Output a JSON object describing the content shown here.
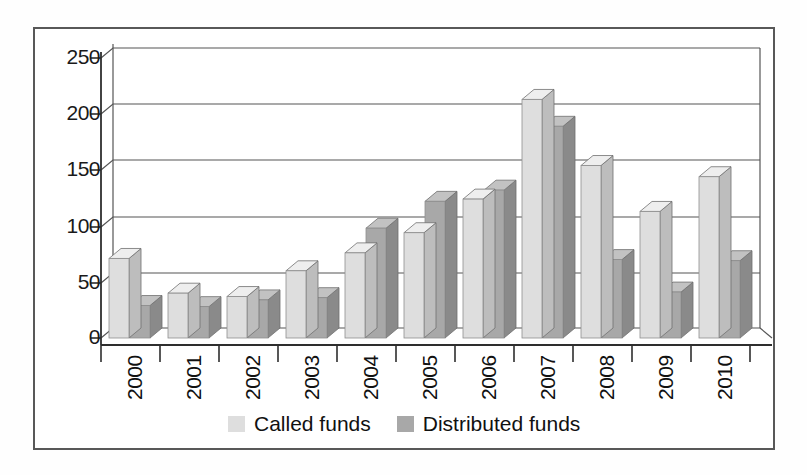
{
  "chart_data": {
    "type": "bar",
    "title": "",
    "subtitle": "",
    "xlabel": "",
    "ylabel": "",
    "categories": [
      "2000",
      "2001",
      "2002",
      "2003",
      "2004",
      "2005",
      "2006",
      "2007",
      "2008",
      "2009",
      "2010"
    ],
    "series": [
      {
        "name": "Called funds",
        "color": "#dedede",
        "values": [
          71,
          40,
          37,
          60,
          76,
          94,
          124,
          213,
          154,
          113,
          144
        ]
      },
      {
        "name": "Distributed funds",
        "color": "#a8a8a8",
        "values": [
          29,
          28,
          34,
          36,
          98,
          122,
          132,
          189,
          70,
          41,
          69
        ]
      }
    ],
    "ylim": [
      0,
      250
    ],
    "yticks": [
      0,
      50,
      100,
      150,
      200,
      250
    ],
    "ytick_labels": [
      "0",
      "50",
      "100",
      "150",
      "200",
      "250"
    ],
    "grid": true,
    "grid_axis": "y",
    "legend_position": "bottom",
    "style": "3d-column",
    "annotations": []
  },
  "axes": {
    "y_tick_labels": [
      "250",
      "200",
      "150",
      "100",
      "50",
      "0"
    ],
    "x_tick_labels": [
      "2000",
      "2001",
      "2002",
      "2003",
      "2004",
      "2005",
      "2006",
      "2007",
      "2008",
      "2009",
      "2010"
    ]
  },
  "legend": {
    "entries": [
      {
        "label": "Called funds",
        "swatch": "#dedede"
      },
      {
        "label": "Distributed funds",
        "swatch": "#a8a8a8"
      }
    ]
  },
  "colors": {
    "called": "#dedede",
    "called_side": "#bdbdbd",
    "called_top": "#eeeeee",
    "distributed": "#a8a8a8",
    "distributed_side": "#8a8a8a",
    "distributed_top": "#c2c2c2",
    "axis": "#333333",
    "grid": "#555555",
    "frame": "#585858",
    "background": "#ffffff"
  }
}
